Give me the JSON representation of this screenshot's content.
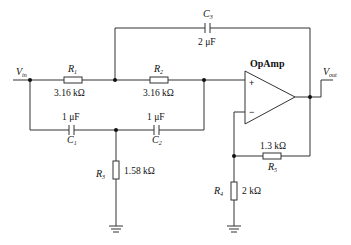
{
  "diagram": {
    "type": "active filter circuit (op-amp)",
    "opamp": {
      "label": "OpAmp",
      "plus": "+",
      "minus": "−"
    },
    "input": {
      "symbol": "V",
      "sub": "in"
    },
    "output": {
      "symbol": "V",
      "sub": "out"
    },
    "components": {
      "R1": {
        "symbol": "R",
        "sub": "1",
        "value": "3.16 kΩ"
      },
      "R2": {
        "symbol": "R",
        "sub": "2",
        "value": "3.16 kΩ"
      },
      "R3": {
        "symbol": "R",
        "sub": "3",
        "value": "1.58 kΩ"
      },
      "R4": {
        "symbol": "R",
        "sub": "4",
        "value": "2 kΩ"
      },
      "R5": {
        "symbol": "R",
        "sub": "5",
        "value": "1.3 kΩ"
      },
      "C1": {
        "symbol": "C",
        "sub": "1",
        "value": "1 μF"
      },
      "C2": {
        "symbol": "C",
        "sub": "2",
        "value": "1 μF"
      },
      "C3": {
        "symbol": "C",
        "sub": "3",
        "value": "2 μF"
      }
    }
  }
}
